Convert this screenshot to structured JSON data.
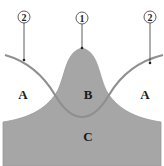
{
  "diagram": {
    "colors": {
      "background": "#ffffff",
      "shape_fill": "#a6a6a6",
      "curve_stroke": "#8f8f8f",
      "leader_line": "#333333",
      "callout_stroke": "#333333"
    },
    "callouts": [
      {
        "id": "left",
        "label": "2",
        "cx": 24,
        "cy": 17,
        "line_to": [
          24,
          60
        ]
      },
      {
        "id": "center",
        "label": "1",
        "cx": 82,
        "cy": 18,
        "line_to": [
          82,
          48
        ]
      },
      {
        "id": "right",
        "label": "2",
        "cx": 150,
        "cy": 17,
        "line_to": [
          150,
          63
        ]
      }
    ],
    "regions": [
      {
        "id": "a-left",
        "label": "A",
        "x": 23,
        "y": 99
      },
      {
        "id": "b",
        "label": "B",
        "x": 88,
        "y": 99
      },
      {
        "id": "a-right",
        "label": "A",
        "x": 145,
        "y": 99
      },
      {
        "id": "c",
        "label": "C",
        "x": 88,
        "y": 141
      }
    ]
  }
}
